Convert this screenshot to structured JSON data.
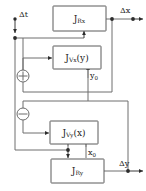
{
  "diagram": {
    "colors": {
      "wire": "#6f6f6f",
      "wire_dark": "#3a3a3a",
      "block_stroke": "#5a5a5a",
      "block_fill": "#ffffff",
      "text": "#222222",
      "node_dot": "#2c2c2c",
      "background": "#ffffff"
    },
    "blocks": [
      {
        "id": "j-rx",
        "base": "J",
        "sub": "Rx",
        "arg": "",
        "label": "J Rx"
      },
      {
        "id": "j-vx",
        "base": "J",
        "sub": "Vx",
        "arg": "(y)",
        "label": "J Vx(y)"
      },
      {
        "id": "j-vy",
        "base": "J",
        "sub": "Vy",
        "arg": "(x)",
        "label": "J Vy(x)"
      },
      {
        "id": "j-ry",
        "base": "J",
        "sub": "Ry",
        "arg": "",
        "label": "J Ry"
      }
    ],
    "junctions": [
      {
        "id": "sum-plus",
        "sign": "+",
        "name": "summing-junction-plus"
      },
      {
        "id": "sum-minus",
        "sign": "−",
        "name": "summing-junction-minus"
      }
    ],
    "signals": {
      "input": {
        "base": "Δt",
        "label": "Δt"
      },
      "output_x": {
        "base": "Δx",
        "label": "Δx"
      },
      "output_y": {
        "base": "Δy",
        "label": "Δy"
      },
      "feedback_y0": {
        "base": "y",
        "sub": "0",
        "label": "y0"
      },
      "feedback_x0": {
        "base": "x",
        "sub": "0",
        "label": "x0"
      }
    }
  }
}
